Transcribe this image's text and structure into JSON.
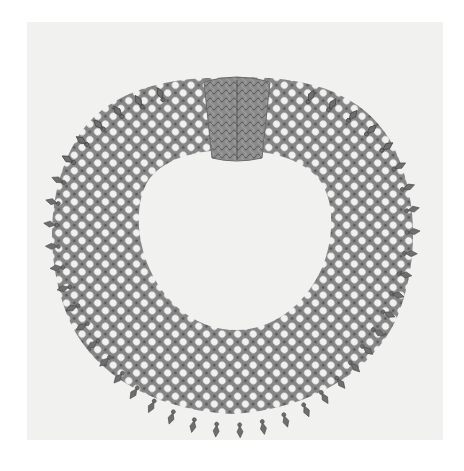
{
  "image": {
    "subject": "mesh bead collar necklace with filigree clasp",
    "style": "grayscale photographic plate",
    "colors": {
      "page": "#ffffff",
      "plate": "#f1f1f0",
      "mesh_dark": "#5e5e5e",
      "mesh_mid": "#8a8a8a",
      "bead_light": "#f4f4f4",
      "clasp": "#7a7a7a",
      "bleed_text": "#e6e6e5"
    },
    "bleed_through_text": [
      "",
      "",
      ""
    ]
  }
}
